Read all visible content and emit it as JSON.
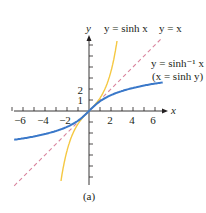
{
  "figure": {
    "caption": "(a)",
    "axis_x_label": "x",
    "axis_y_label": "y",
    "x_tick_labels": [
      "−6",
      "−4",
      "−2",
      "2",
      "4",
      "6"
    ],
    "y_tick_labels": [
      "1",
      "2"
    ],
    "labels": {
      "sinh": "y = sinh x",
      "identity": "y = x",
      "asinh_line1": "y = sinh⁻¹ x",
      "asinh_line2": "(x = sinh y)"
    },
    "colors": {
      "sinh": "#f5c842",
      "asinh": "#3a78c9",
      "identity": "#d9849e",
      "axis": "#231f20"
    }
  },
  "chart_data": {
    "type": "line",
    "title": "",
    "xlabel": "x",
    "ylabel": "y",
    "xlim": [
      -7,
      7
    ],
    "ylim": [
      -7,
      7
    ],
    "x_ticks": [
      -6,
      -4,
      -2,
      2,
      4,
      6
    ],
    "y_ticks": [
      1,
      2
    ],
    "grid": false,
    "legend": "inline annotations",
    "caption": "(a)",
    "series": [
      {
        "name": "y = sinh x",
        "color": "#f5c842",
        "style": "solid",
        "x": [
          -2.55,
          -2.0,
          -1.5,
          -1.0,
          -0.5,
          0,
          0.5,
          1.0,
          1.5,
          2.0,
          2.55
        ],
        "y": [
          -6.37,
          -3.63,
          -2.13,
          -1.18,
          -0.52,
          0,
          0.52,
          1.18,
          2.13,
          3.63,
          6.37
        ]
      },
      {
        "name": "y = x",
        "color": "#d9849e",
        "style": "dashed",
        "x": [
          -6.8,
          6.7
        ],
        "y": [
          -6.8,
          6.7
        ]
      },
      {
        "name": "y = sinh⁻¹ x (x = sinh y)",
        "color": "#3a78c9",
        "style": "solid",
        "x": [
          -6.8,
          -6,
          -4,
          -2,
          -1,
          0,
          1,
          2,
          4,
          6,
          6.7
        ],
        "y": [
          -2.62,
          -2.49,
          -2.09,
          -1.44,
          -0.88,
          0,
          0.88,
          1.44,
          2.09,
          2.49,
          2.6
        ]
      }
    ]
  }
}
